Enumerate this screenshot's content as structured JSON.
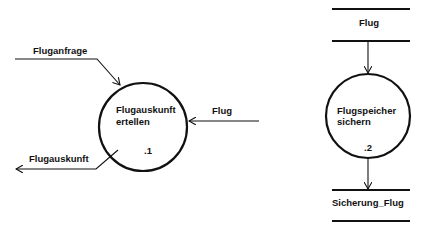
{
  "diagram": {
    "type": "data-flow-diagram",
    "processes": [
      {
        "id": "p1",
        "label_line1": "Flugauskunft",
        "label_line2": "ertellen",
        "number": ".1"
      },
      {
        "id": "p2",
        "label_line1": "Flugspeicher",
        "label_line2": "sichern",
        "number": ".2"
      }
    ],
    "flows": [
      {
        "id": "f1",
        "label": "Fluganfrage",
        "from": "external",
        "to": "p1"
      },
      {
        "id": "f2",
        "label": "Flug",
        "from": "external",
        "to": "p1"
      },
      {
        "id": "f3",
        "label": "Flugauskunft",
        "from": "p1",
        "to": "external"
      },
      {
        "id": "f4",
        "from": "store-flug",
        "to": "p2"
      },
      {
        "id": "f5",
        "from": "p2",
        "to": "store-sicherung"
      }
    ],
    "stores": [
      {
        "id": "store-flug",
        "label": "Flug"
      },
      {
        "id": "store-sicherung",
        "label": "Sicherung_Flug"
      }
    ]
  }
}
